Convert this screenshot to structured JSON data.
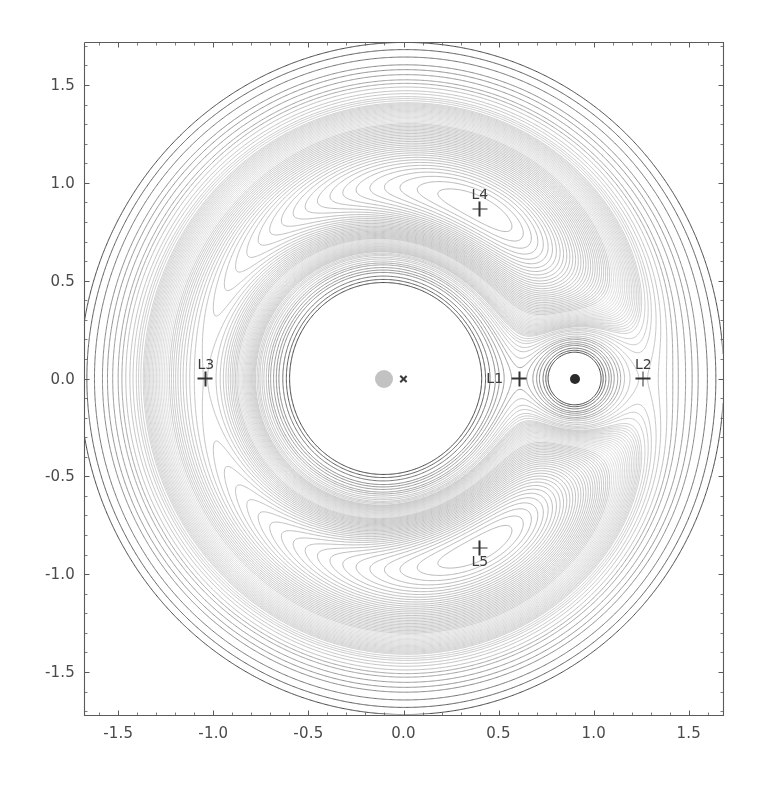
{
  "figure": {
    "background_color": "#ffffff",
    "width": 769,
    "height": 787
  },
  "axes": {
    "left_px": 84,
    "top_px": 42,
    "right_px": 723,
    "bottom_px": 715,
    "spine_color": "#5a5a5a",
    "xlim": [
      -1.68,
      1.68
    ],
    "ylim": [
      -1.72,
      1.72
    ],
    "xlabel": "",
    "ylabel": "",
    "grid": false,
    "xticks": [
      -1.5,
      -1.0,
      -0.5,
      0.0,
      0.5,
      1.0,
      1.5
    ],
    "xtick_labels": [
      "-1.5",
      "-1.0",
      "-0.5",
      "0.0",
      "0.5",
      "1.0",
      "1.5"
    ],
    "yticks": [
      -1.5,
      -1.0,
      -0.5,
      0.0,
      0.5,
      1.0,
      1.5
    ],
    "ytick_labels": [
      "-1.5",
      "-1.0",
      "-0.5",
      "0.0",
      "0.5",
      "1.0",
      "1.5"
    ],
    "minor_tick_count": 4
  },
  "chart_data": {
    "type": "contour",
    "title": "",
    "xlabel": "",
    "ylabel": "",
    "xlim": [
      -1.68,
      1.68
    ],
    "ylim": [
      -1.72,
      1.72
    ],
    "grid": false,
    "colormap": "grayscale",
    "line_color_dark": "#3f3f3f",
    "line_color_light": "#c8c8c8",
    "model": {
      "mass_ratio_mu": 0.1,
      "primary_position": [
        -0.1,
        0.0
      ],
      "secondary_position": [
        0.9,
        0.0
      ],
      "barycenter_position": [
        0.0,
        0.0
      ],
      "potential_formula": "-(1-mu)/r1 - mu/r2 - 0.5*(x^2+y^2)"
    },
    "contour_levels": [
      -2.05,
      -2.0,
      -1.95,
      -1.9,
      -1.87,
      -1.84,
      -1.81,
      -1.79,
      -1.77,
      -1.75,
      -1.735,
      -1.72,
      -1.71,
      -1.7,
      -1.69,
      -1.685,
      -1.68,
      -1.675,
      -1.67,
      -1.665,
      -1.66,
      -1.655,
      -1.65,
      -1.645,
      -1.64,
      -1.635,
      -1.63,
      -1.625,
      -1.62,
      -1.615,
      -1.61,
      -1.605,
      -1.6,
      -1.595,
      -1.59,
      -1.585,
      -1.58,
      -1.575,
      -1.57,
      -1.565,
      -1.56,
      -1.555,
      -1.55,
      -1.545,
      -1.54,
      -1.535,
      -1.53,
      -1.525,
      -1.52,
      -1.515,
      -1.51,
      -1.505,
      -1.5,
      -1.495,
      -1.49,
      -1.485,
      -1.48,
      -1.475,
      -1.47,
      -1.465,
      -1.46,
      -1.455,
      -1.45,
      -1.44,
      -1.43,
      -1.42,
      -1.41,
      -1.4,
      -1.39,
      -1.38,
      -1.37,
      -1.36,
      -1.35,
      -1.34,
      -1.33,
      -1.32,
      -1.31,
      -1.3,
      -1.29,
      -1.28,
      -1.27,
      -1.26,
      -1.25,
      -1.24
    ],
    "markers": [
      {
        "name": "primary-body",
        "kind": "disk",
        "x": -0.1,
        "y": 0.0,
        "radius_px": 9,
        "color": "#b5b5b5",
        "label": ""
      },
      {
        "name": "barycenter",
        "kind": "cross",
        "x": 0.0,
        "y": 0.0,
        "color": "#3b3b3b",
        "label": ""
      },
      {
        "name": "secondary-body",
        "kind": "disk",
        "x": 0.9,
        "y": 0.0,
        "radius_px": 5,
        "color": "#2a2a2a",
        "label": ""
      }
    ],
    "lagrange_points": [
      {
        "id": "L1",
        "label": "L1",
        "x": 0.6091,
        "y": 0.0,
        "label_side": "left"
      },
      {
        "id": "L2",
        "label": "L2",
        "x": 1.2596,
        "y": 0.0,
        "label_side": "above"
      },
      {
        "id": "L3",
        "label": "L3",
        "x": -1.0417,
        "y": 0.0,
        "label_side": "above"
      },
      {
        "id": "L4",
        "label": "L4",
        "x": 0.4,
        "y": 0.866,
        "label_side": "above"
      },
      {
        "id": "L5",
        "label": "L5",
        "x": 0.4,
        "y": -0.866,
        "label_side": "below"
      }
    ]
  }
}
